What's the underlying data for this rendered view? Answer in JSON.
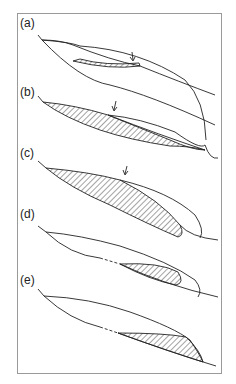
{
  "figure": {
    "panels": [
      {
        "id": "a",
        "label": "(a)",
        "has_arrow": true,
        "has_dashed_segment": false
      },
      {
        "id": "b",
        "label": "(b)",
        "has_arrow": true,
        "has_dashed_segment": false
      },
      {
        "id": "c",
        "label": "(c)",
        "has_arrow": true,
        "has_dashed_segment": false
      },
      {
        "id": "d",
        "label": "(d)",
        "has_arrow": false,
        "has_dashed_segment": true
      },
      {
        "id": "e",
        "label": "(e)",
        "has_arrow": false,
        "has_dashed_segment": true
      }
    ],
    "colors": {
      "line": "#222222",
      "hatch": "#333333",
      "frame": "#9a9a9a",
      "background": "#ffffff"
    }
  }
}
